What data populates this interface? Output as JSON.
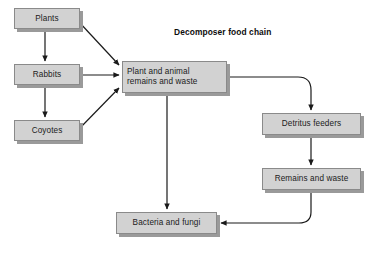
{
  "diagram": {
    "title": "Decomposer food chain",
    "bottom_caption": "",
    "colors": {
      "box_fill": "#d2d2d2",
      "box_border": "#8a8a8a",
      "box_shadow": "#9a9a9a",
      "arrow": "#1a1a1a",
      "text": "#1b1b1b",
      "background": "#ffffff"
    },
    "nodes": [
      {
        "id": "plants",
        "label": "Plants",
        "x": 14,
        "y": 8,
        "w": 66,
        "h": 21,
        "align": "center"
      },
      {
        "id": "rabbits",
        "label": "Rabbits",
        "x": 14,
        "y": 64,
        "w": 66,
        "h": 21,
        "align": "center"
      },
      {
        "id": "coyotes",
        "label": "Coyotes",
        "x": 14,
        "y": 120,
        "w": 66,
        "h": 21,
        "align": "center"
      },
      {
        "id": "plant-animal-remains",
        "label": "Plant and animal\nremains and waste",
        "x": 122,
        "y": 61,
        "w": 105,
        "h": 32,
        "align": "left"
      },
      {
        "id": "detritus-feeders",
        "label": "Detritus feeders",
        "x": 262,
        "y": 113,
        "w": 99,
        "h": 22,
        "align": "center"
      },
      {
        "id": "remains-and-waste",
        "label": "Remains and waste",
        "x": 262,
        "y": 168,
        "w": 99,
        "h": 22,
        "align": "center"
      },
      {
        "id": "bacteria-and-fungi",
        "label": "Bacteria and fungi",
        "x": 116,
        "y": 212,
        "w": 101,
        "h": 22,
        "align": "center"
      }
    ],
    "edges": [
      {
        "id": "plants-to-rabbits",
        "from": "plants",
        "to": "rabbits",
        "kind": "straight-vertical"
      },
      {
        "id": "rabbits-to-coyotes",
        "from": "rabbits",
        "to": "coyotes",
        "kind": "straight-vertical"
      },
      {
        "id": "plants-to-remains",
        "from": "plants",
        "to": "plant-animal-remains",
        "kind": "diagonal"
      },
      {
        "id": "rabbits-to-remains",
        "from": "rabbits",
        "to": "plant-animal-remains",
        "kind": "straight-horizontal"
      },
      {
        "id": "coyotes-to-remains",
        "from": "coyotes",
        "to": "plant-animal-remains",
        "kind": "diagonal"
      },
      {
        "id": "remains-to-detritus",
        "from": "plant-animal-remains",
        "to": "detritus-feeders",
        "kind": "elbow-right-down"
      },
      {
        "id": "detritus-to-remains-waste",
        "from": "detritus-feeders",
        "to": "remains-and-waste",
        "kind": "straight-vertical"
      },
      {
        "id": "remains-waste-to-bacteria",
        "from": "remains-and-waste",
        "to": "bacteria-and-fungi",
        "kind": "elbow-down-left"
      },
      {
        "id": "remains-to-bacteria",
        "from": "plant-animal-remains",
        "to": "bacteria-and-fungi",
        "kind": "straight-vertical"
      }
    ]
  }
}
